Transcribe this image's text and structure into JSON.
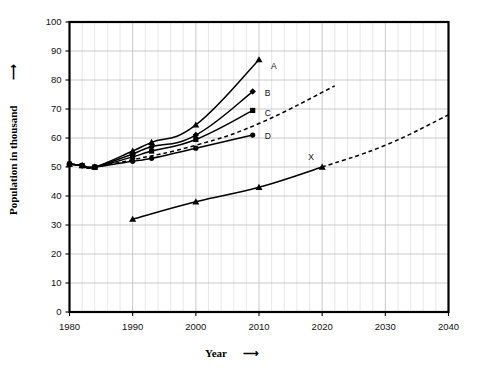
{
  "chart_data": {
    "type": "line",
    "title": "",
    "xlabel": "Year",
    "ylabel": "Population in thousand",
    "xlim": [
      1980,
      2040
    ],
    "ylim": [
      0,
      100
    ],
    "x_ticks": [
      1980,
      1990,
      2000,
      2010,
      2020,
      2030,
      2040
    ],
    "y_ticks": [
      0,
      10,
      20,
      30,
      40,
      50,
      60,
      70,
      80,
      90,
      100
    ],
    "x_minor_step": 2,
    "grid": true,
    "legend_position": "inline-right-of-line-end",
    "series": [
      {
        "name": "A",
        "label": "A",
        "marker": "triangle",
        "style": "solid",
        "x": [
          1980,
          1982,
          1984,
          1990,
          1993,
          2000,
          2010
        ],
        "values": [
          51,
          50.5,
          50,
          55.5,
          58.5,
          64.5,
          87
        ]
      },
      {
        "name": "B",
        "label": "B",
        "marker": "diamond",
        "style": "solid",
        "x": [
          1980,
          1982,
          1984,
          1990,
          1993,
          2000,
          2009
        ],
        "values": [
          51,
          50.5,
          50,
          54.5,
          57,
          61,
          76
        ]
      },
      {
        "name": "C",
        "label": "C",
        "marker": "square",
        "style": "solid-then-dashed",
        "x": [
          1980,
          1982,
          1984,
          1990,
          1993,
          2000,
          2009
        ],
        "values": [
          51,
          50.5,
          50,
          53.5,
          55.5,
          59.5,
          69.5
        ],
        "projection_x": [
          1984,
          1990,
          2000,
          2010,
          2022
        ],
        "projection_values": [
          50,
          52.5,
          57.5,
          65,
          78
        ]
      },
      {
        "name": "D",
        "label": "D",
        "marker": "circle",
        "style": "solid",
        "x": [
          1980,
          1982,
          1984,
          1990,
          1993,
          2000,
          2009
        ],
        "values": [
          51,
          50.5,
          50,
          52,
          53,
          56.5,
          61
        ]
      },
      {
        "name": "X",
        "label": "X",
        "marker": "triangle",
        "style": "solid-then-dashed",
        "x": [
          1990,
          2000,
          2010,
          2020
        ],
        "values": [
          32,
          38,
          43,
          50
        ],
        "projection_x": [
          2020,
          2030,
          2040
        ],
        "projection_values": [
          50,
          57.5,
          68
        ]
      }
    ]
  },
  "axes": {
    "y_axis_title": "Population in thousand",
    "y_axis_arrow": "⟶",
    "x_axis_title": "Year",
    "x_axis_arrow": "⟶"
  },
  "tick_labels": {
    "y": [
      "100",
      "90",
      "80",
      "70",
      "60",
      "50",
      "40",
      "30",
      "20",
      "10",
      "0"
    ],
    "x": [
      "1980",
      "1990",
      "2000",
      "2010",
      "2020",
      "2030",
      "2040"
    ]
  },
  "series_labels": {
    "a": "A",
    "b": "B",
    "c": "C",
    "d": "D",
    "x": "X"
  },
  "colors": {
    "background": "#ffffff",
    "ink": "#000000",
    "grid_minor": "#d7d7d7",
    "grid_major": "#bcbcbc"
  }
}
